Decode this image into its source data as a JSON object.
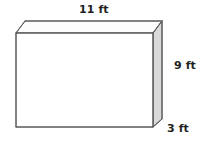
{
  "figure": {
    "kind": "rectangular-prism",
    "projection": "oblique",
    "colors": {
      "outline": "#58595b",
      "front_face": "#ffffff",
      "top_face": "#fdfdfd",
      "right_face": "#d9d9d9",
      "label_text": "#231f20",
      "background": "#ffffff"
    },
    "geometry": {
      "front_top_left": [
        16,
        33
      ],
      "front_top_right": [
        153,
        33
      ],
      "front_bottom_right": [
        153,
        127
      ],
      "front_bottom_left": [
        16,
        127
      ],
      "back_top_left": [
        25,
        21
      ],
      "back_top_right": [
        162,
        21
      ],
      "back_bottom_right": [
        162,
        119
      ]
    },
    "labels": {
      "width": "11 ft",
      "height": "9 ft",
      "depth": "3 ft"
    }
  }
}
